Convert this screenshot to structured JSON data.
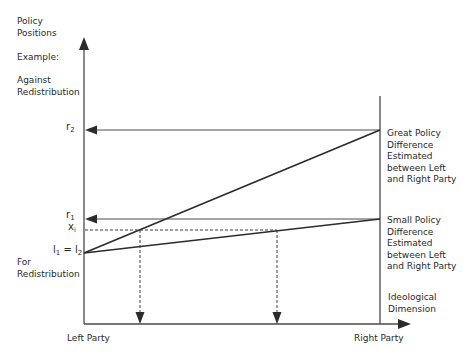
{
  "diagram": {
    "y_axis": {
      "title_line1": "Policy",
      "title_line2": "Positions",
      "example_label": "Example:",
      "top_label_line1": "Against",
      "top_label_line2": "Redistribution",
      "bottom_label_line1": "For",
      "bottom_label_line2": "Redistribution",
      "ticks": {
        "r2": {
          "base": "r",
          "sub": "2"
        },
        "r1": {
          "base": "r",
          "sub": "1"
        },
        "xi": {
          "base": "x",
          "sub": "i"
        },
        "l1_l2": {
          "base1": "l",
          "sub1": "1",
          "eq": " = ",
          "base2": "l",
          "sub2": "2"
        }
      }
    },
    "x_axis": {
      "left_label": "Left Party",
      "right_label": "Right Party",
      "dimension_line1": "Ideological",
      "dimension_line2": "Dimension"
    },
    "annotations": {
      "great": [
        "Great Policy",
        "Difference",
        "Estimated",
        "between Left",
        "and Right Party"
      ],
      "small": [
        "Small Policy",
        "Difference",
        "Estimated",
        "between Left",
        "and Right Party"
      ]
    },
    "colors": {
      "line": "#2b2b2b",
      "text": "#2a2a2a",
      "background": "#ffffff"
    }
  }
}
